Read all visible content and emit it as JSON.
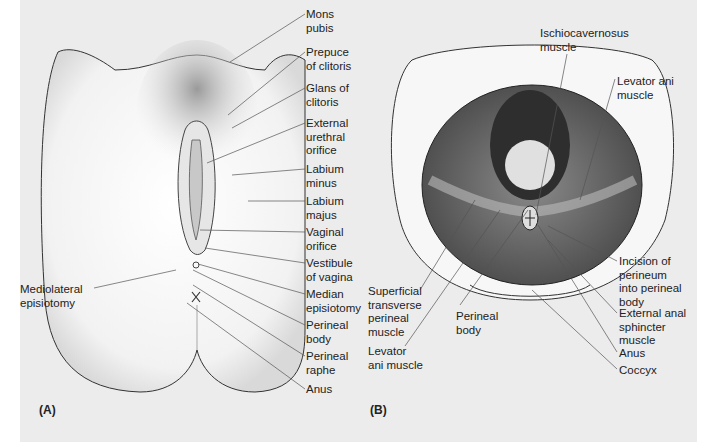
{
  "figure": {
    "panels": [
      {
        "id": "A",
        "tag": "(A)",
        "labels": [
          {
            "text": "Mons\npubis",
            "x": 306,
            "y": 8,
            "lx1": 305,
            "ly1": 14,
            "lx2": 230,
            "ly2": 62
          },
          {
            "text": "Prepuce\nof clitoris",
            "x": 306,
            "y": 46,
            "lx1": 305,
            "ly1": 52,
            "lx2": 228,
            "ly2": 115
          },
          {
            "text": "Glans of\nclitoris",
            "x": 306,
            "y": 82,
            "lx1": 305,
            "ly1": 88,
            "lx2": 232,
            "ly2": 128
          },
          {
            "text": "External\nurethral\norifice",
            "x": 306,
            "y": 117,
            "lx1": 305,
            "ly1": 123,
            "lx2": 207,
            "ly2": 163
          },
          {
            "text": "Labium\nminus",
            "x": 306,
            "y": 163,
            "lx1": 305,
            "ly1": 169,
            "lx2": 232,
            "ly2": 175
          },
          {
            "text": "Labium\nmajus",
            "x": 306,
            "y": 195,
            "lx1": 305,
            "ly1": 201,
            "lx2": 248,
            "ly2": 201
          },
          {
            "text": "Vaginal\norifice",
            "x": 306,
            "y": 226,
            "lx1": 305,
            "ly1": 232,
            "lx2": 200,
            "ly2": 230
          },
          {
            "text": "Vestibule\nof vagina",
            "x": 306,
            "y": 257,
            "lx1": 305,
            "ly1": 263,
            "lx2": 205,
            "ly2": 248
          },
          {
            "text": "Median\nepisiotomy",
            "x": 306,
            "y": 288,
            "lx1": 305,
            "ly1": 294,
            "lx2": 198,
            "ly2": 264
          },
          {
            "text": "Perineal\nbody",
            "x": 306,
            "y": 319,
            "lx1": 305,
            "ly1": 325,
            "lx2": 193,
            "ly2": 270
          },
          {
            "text": "Perineal\nraphe",
            "x": 306,
            "y": 350,
            "lx1": 305,
            "ly1": 356,
            "lx2": 193,
            "ly2": 285
          },
          {
            "text": "Anus",
            "x": 306,
            "y": 383,
            "lx1": 305,
            "ly1": 389,
            "lx2": 187,
            "ly2": 303
          },
          {
            "text": "Mediolateral\nepisiotomy",
            "x": 20,
            "y": 283,
            "lx1": 94,
            "ly1": 288,
            "lx2": 176,
            "ly2": 270,
            "align": "left"
          }
        ]
      },
      {
        "id": "B",
        "tag": "(B)",
        "labels": [
          {
            "text": "Ischiocavernosus\nmuscle",
            "x": 540,
            "y": 27,
            "lx1": 567,
            "ly1": 54,
            "lx2": 536,
            "ly2": 215
          },
          {
            "text": "Levator ani\nmuscle",
            "x": 617,
            "y": 75,
            "lx1": 615,
            "ly1": 79,
            "lx2": 580,
            "ly2": 200
          },
          {
            "text": "Superficial\ntransverse\nperineal\nmuscle",
            "x": 368,
            "y": 285,
            "lx1": 420,
            "ly1": 290,
            "lx2": 475,
            "ly2": 200
          },
          {
            "text": "Levator\nani muscle",
            "x": 368,
            "y": 345,
            "lx1": 405,
            "ly1": 346,
            "lx2": 500,
            "ly2": 210
          },
          {
            "text": "Perineal\nbody",
            "x": 456,
            "y": 310,
            "lx1": 460,
            "ly1": 305,
            "lx2": 528,
            "ly2": 210
          },
          {
            "text": "Incision of\nperineum\ninto perineal\nbody",
            "x": 619,
            "y": 255,
            "lx1": 617,
            "ly1": 261,
            "lx2": 548,
            "ly2": 226
          },
          {
            "text": "External anal\nsphincter\nmuscle",
            "x": 619,
            "y": 307,
            "lx1": 617,
            "ly1": 313,
            "lx2": 548,
            "ly2": 240
          },
          {
            "text": "Anus",
            "x": 619,
            "y": 347,
            "lx1": 617,
            "ly1": 352,
            "lx2": 538,
            "ly2": 225
          },
          {
            "text": "Coccyx",
            "x": 619,
            "y": 364,
            "lx1": 617,
            "ly1": 369,
            "lx2": 532,
            "ly2": 290
          }
        ]
      }
    ]
  }
}
